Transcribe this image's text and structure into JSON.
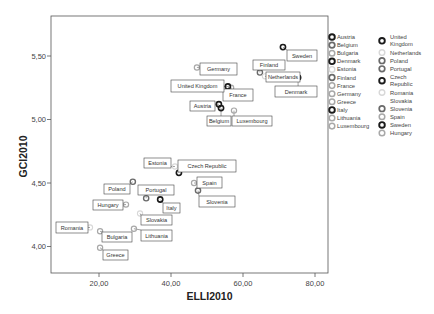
{
  "chart_data": {
    "type": "scatter",
    "title": "",
    "xlabel": "ELLI2010",
    "ylabel": "GCI2010",
    "xlim": [
      5.5,
      84
    ],
    "ylim": [
      3.8,
      5.65
    ],
    "xticks": [
      20,
      40,
      60,
      80
    ],
    "xtick_labels": [
      "20,00",
      "40,00",
      "60,00",
      "80,00"
    ],
    "yticks": [
      4.0,
      4.5,
      5.0,
      5.5
    ],
    "ytick_labels": [
      "4,00",
      "4,50",
      "5,00",
      "5,50"
    ],
    "grid": false,
    "legend_position": "right",
    "points": [
      {
        "country": "Austria",
        "x": 53.3,
        "y": 5.12,
        "style": "dark",
        "label_box": [
          190,
          101,
          25,
          10
        ]
      },
      {
        "country": "Belgium",
        "x": 53.9,
        "y": 5.09,
        "style": "dark",
        "label_box": [
          207,
          116,
          24,
          10
        ]
      },
      {
        "country": "Bulgaria",
        "x": 20.3,
        "y": 4.12,
        "style": "light",
        "label_box": [
          102,
          232,
          30,
          10
        ]
      },
      {
        "country": "Denmark",
        "x": 75.3,
        "y": 5.33,
        "style": "dark",
        "label_box": [
          275,
          86,
          42,
          11
        ]
      },
      {
        "country": "Estonia",
        "x": 41.1,
        "y": 4.63,
        "style": "faint",
        "label_box": [
          144,
          158,
          27,
          10
        ]
      },
      {
        "country": "Finland",
        "x": 64.7,
        "y": 5.37,
        "style": "mid",
        "label_box": [
          253,
          60,
          32,
          10
        ]
      },
      {
        "country": "France",
        "x": 56.7,
        "y": 5.25,
        "style": "light",
        "label_box": [
          223,
          89,
          30,
          12
        ]
      },
      {
        "country": "Germany",
        "x": 47.2,
        "y": 5.41,
        "style": "light",
        "label_box": [
          200,
          63,
          37,
          12
        ]
      },
      {
        "country": "Greece",
        "x": 20.3,
        "y": 3.99,
        "style": "light",
        "label_box": [
          103,
          250,
          25,
          10
        ]
      },
      {
        "country": "Italy",
        "x": 37.0,
        "y": 4.37,
        "style": "dark",
        "label_box": [
          163,
          203,
          17,
          10
        ]
      },
      {
        "country": "Lithuania",
        "x": 29.7,
        "y": 4.14,
        "style": "light",
        "label_box": [
          141,
          230,
          31,
          11
        ]
      },
      {
        "country": "Luxembourg",
        "x": 57.5,
        "y": 5.07,
        "style": "light",
        "label_box": [
          232,
          116,
          40,
          10
        ]
      },
      {
        "country": "United Kingdom",
        "x": 55.8,
        "y": 5.26,
        "style": "dark",
        "label_box": [
          171,
          80,
          53,
          12
        ]
      },
      {
        "country": "Netherlands",
        "x": 66.1,
        "y": 5.34,
        "style": "faint",
        "label_box": [
          266,
          72,
          34,
          10
        ]
      },
      {
        "country": "Poland",
        "x": 29.4,
        "y": 4.51,
        "style": "mid",
        "label_box": [
          104,
          184,
          26,
          10
        ]
      },
      {
        "country": "Portugal",
        "x": 33.1,
        "y": 4.38,
        "style": "mid",
        "label_box": [
          138,
          185,
          36,
          10
        ]
      },
      {
        "country": "Czech Republic",
        "x": 42.2,
        "y": 4.58,
        "style": "dark",
        "label_box": [
          178,
          160,
          58,
          12
        ]
      },
      {
        "country": "Romania",
        "x": 17.5,
        "y": 4.15,
        "style": "faint",
        "label_box": [
          56,
          222,
          32,
          11
        ]
      },
      {
        "country": "Slovakia",
        "x": 31.4,
        "y": 4.26,
        "style": "faint",
        "label_box": [
          141,
          215,
          31,
          10
        ]
      },
      {
        "country": "Slovenia",
        "x": 47.5,
        "y": 4.44,
        "style": "mid",
        "label_box": [
          199,
          196,
          36,
          11
        ]
      },
      {
        "country": "Spain",
        "x": 46.4,
        "y": 4.5,
        "style": "light",
        "label_box": [
          197,
          177,
          25,
          11
        ]
      },
      {
        "country": "Sweden",
        "x": 71.1,
        "y": 5.57,
        "style": "dark",
        "label_box": [
          287,
          50,
          30,
          11
        ]
      },
      {
        "country": "Hungary",
        "x": 27.5,
        "y": 4.33,
        "style": "light",
        "label_box": [
          93,
          200,
          30,
          10
        ]
      }
    ]
  },
  "legend": {
    "left_column": [
      {
        "label": "Austria",
        "style": "dark"
      },
      {
        "label": "Belgium",
        "style": "mid"
      },
      {
        "label": "Bulgaria",
        "style": "light"
      },
      {
        "label": "Denmark",
        "style": "dark"
      },
      {
        "label": "Estonia",
        "style": "faint"
      },
      {
        "label": "Finland",
        "style": "mid"
      },
      {
        "label": "France",
        "style": "light"
      },
      {
        "label": "Germany",
        "style": "light"
      },
      {
        "label": "Greece",
        "style": "light"
      },
      {
        "label": "Italy",
        "style": "dark"
      },
      {
        "label": "Lithuania",
        "style": "light"
      },
      {
        "label": "Luxembourg",
        "style": "light"
      }
    ],
    "right_column": [
      {
        "label": "United Kingdom",
        "lines": [
          "United",
          "Kingdom"
        ],
        "style": "dark"
      },
      {
        "label": "Netherlands",
        "lines": [
          "Netherlands"
        ],
        "style": "faint"
      },
      {
        "label": "Poland",
        "lines": [
          "Poland"
        ],
        "style": "mid"
      },
      {
        "label": "Portugal",
        "lines": [
          "Portugal"
        ],
        "style": "mid"
      },
      {
        "label": "Czech Republic",
        "lines": [
          "Czech",
          "Republic"
        ],
        "style": "dark"
      },
      {
        "label": "Romania",
        "lines": [
          "Romania"
        ],
        "style": "faint"
      },
      {
        "label": "Slovakia",
        "lines": [
          "Slovakia"
        ],
        "style": "none"
      },
      {
        "label": "Slovenia",
        "lines": [
          "Slovenia"
        ],
        "style": "mid"
      },
      {
        "label": "Spain",
        "lines": [
          "Spain"
        ],
        "style": "light"
      },
      {
        "label": "Sweden",
        "lines": [
          "Sweden"
        ],
        "style": "dark"
      },
      {
        "label": "Hungary",
        "lines": [
          "Hungary"
        ],
        "style": "light"
      }
    ]
  },
  "styles": {
    "dark": {
      "stroke": "#1a1a1a",
      "width": 1.6
    },
    "mid": {
      "stroke": "#6a6a6a",
      "width": 1.4
    },
    "light": {
      "stroke": "#a8a8a8",
      "width": 1.2
    },
    "faint": {
      "stroke": "#d8d8d8",
      "width": 1.1
    },
    "none": {
      "stroke": "none",
      "width": 0
    }
  },
  "layout": {
    "plot": {
      "left": 51,
      "top": 16,
      "right": 328,
      "bottom": 273
    },
    "x_px": {
      "ref_value": 20,
      "ref_px": 99,
      "px_per_unit": 3.6
    },
    "y_px": {
      "ref_value": 5.5,
      "ref_px": 56,
      "px_per_unit": 127
    }
  }
}
